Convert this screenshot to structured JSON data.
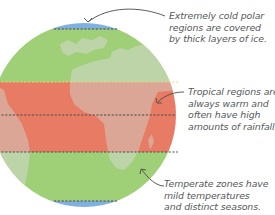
{
  "diagram": {
    "colors": {
      "polar": "#7fb0e0",
      "temperate": "#9fcf76",
      "tropical": "#e87b64",
      "land_temperate": "#bdd3a8",
      "land_tropical": "#dba695",
      "dashed_line": "#4a4a4a",
      "arrow": "#4a4a4a",
      "text": "#555a5c"
    },
    "annotations": [
      {
        "zone": "polar",
        "lines": [
          "Extremely cold polar",
          "regions are covered",
          "by thick layers of ice."
        ]
      },
      {
        "zone": "tropical",
        "lines": [
          "Tropical regions are",
          "always warm and",
          "often have high",
          "amounts of rainfall."
        ]
      },
      {
        "zone": "temperate",
        "lines": [
          "Temperate zones have",
          "mild temperatures",
          "and distinct seasons."
        ]
      }
    ]
  }
}
